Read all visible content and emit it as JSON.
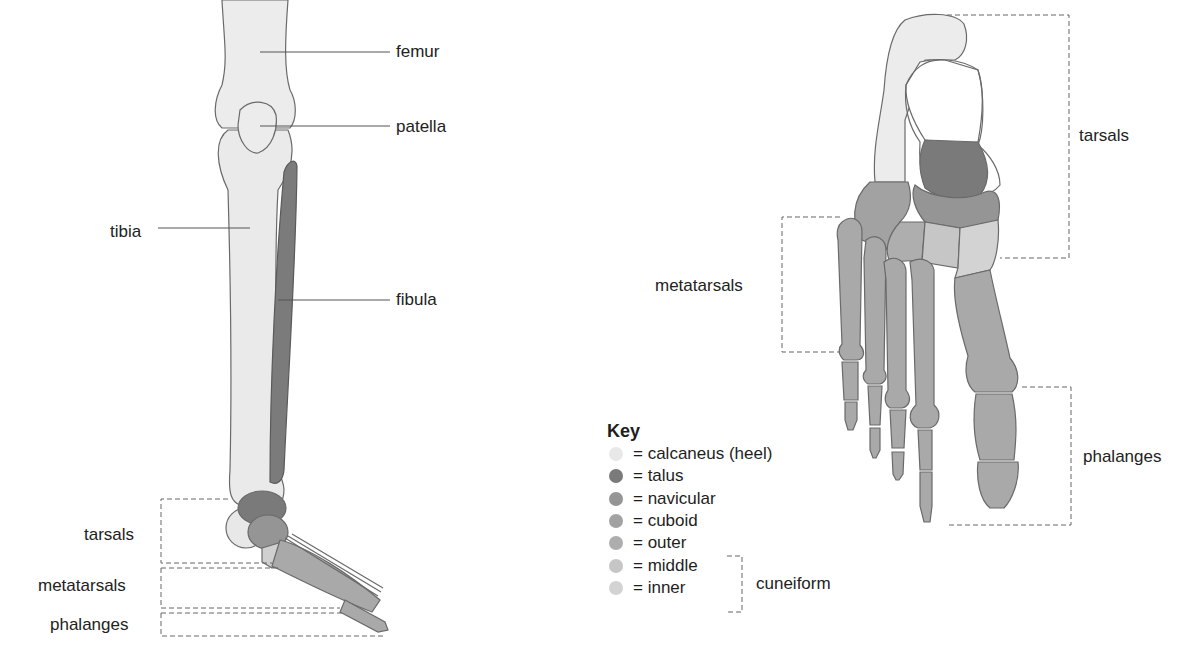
{
  "left_figure": {
    "labels": {
      "femur": "femur",
      "patella": "patella",
      "tibia": "tibia",
      "fibula": "fibula",
      "tarsals": "tarsals",
      "metatarsals": "metatarsals",
      "phalanges": "phalanges"
    }
  },
  "right_figure": {
    "labels": {
      "tarsals": "tarsals",
      "metatarsals": "metatarsals",
      "phalanges": "phalanges"
    }
  },
  "key": {
    "title": "Key",
    "items": [
      {
        "label": "= calcaneus (heel)",
        "color": "#e8e8e8"
      },
      {
        "label": "= talus",
        "color": "#7a7a7a"
      },
      {
        "label": "= navicular",
        "color": "#959595"
      },
      {
        "label": "= cuboid",
        "color": "#a2a2a2"
      },
      {
        "label": "= outer",
        "color": "#aeaeae"
      },
      {
        "label": "= middle",
        "color": "#c6c6c6"
      },
      {
        "label": "= inner",
        "color": "#d3d3d3"
      }
    ],
    "group_label": "cuneiform"
  },
  "colors": {
    "bone_light": "#ececec",
    "bone_mid": "#a9a9a9",
    "fibula": "#7b7b7b",
    "outline": "#666666"
  }
}
